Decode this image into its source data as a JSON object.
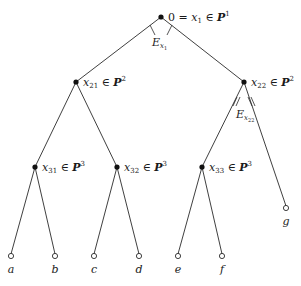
{
  "diagram": {
    "type": "game-tree",
    "root": {
      "id": "x1",
      "label_prefix": "0 = ",
      "var": "x",
      "sub": "1",
      "rel": " ∈ ",
      "set": "P",
      "sup": "1",
      "info_set_label": "E",
      "info_set_sub": "x",
      "info_set_subsub": "1"
    },
    "level2": [
      {
        "id": "x21",
        "var": "x",
        "sub": "21",
        "rel": " ∈ ",
        "set": "P",
        "sup": "2"
      },
      {
        "id": "x22",
        "var": "x",
        "sub": "22",
        "rel": " ∈ ",
        "set": "P",
        "sup": "2",
        "info_set_label": "E",
        "info_set_sub": "x",
        "info_set_subsub": "22"
      }
    ],
    "level3": [
      {
        "id": "x31",
        "var": "x",
        "sub": "31",
        "rel": " ∈ ",
        "set": "P",
        "sup": "3"
      },
      {
        "id": "x32",
        "var": "x",
        "sub": "32",
        "rel": " ∈ ",
        "set": "P",
        "sup": "3"
      },
      {
        "id": "x33",
        "var": "x",
        "sub": "33",
        "rel": " ∈ ",
        "set": "P",
        "sup": "3"
      }
    ],
    "terminals": [
      "a",
      "b",
      "c",
      "d",
      "e",
      "f",
      "g"
    ]
  }
}
